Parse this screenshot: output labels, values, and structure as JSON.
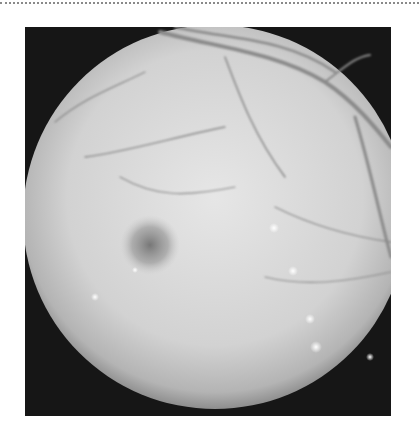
{
  "image": {
    "subject": "fundus-photograph",
    "mode": "grayscale",
    "frame": {
      "x": 25,
      "y": 27,
      "width": 366,
      "height": 389,
      "background": "#161616"
    },
    "disc": {
      "cx": 190,
      "cy": 190,
      "r": 192,
      "fill_center": "#e2e2e2",
      "fill_edge": "#9a9a9a"
    },
    "macula": {
      "cx": 125,
      "cy": 218,
      "r": 26,
      "color": "#7c7c7c"
    },
    "vessel_color": "#8a8a8a",
    "exudate_color": "#f6f6f6",
    "exudates": [
      {
        "x": 249,
        "y": 201,
        "r": 4
      },
      {
        "x": 268,
        "y": 244,
        "r": 4
      },
      {
        "x": 285,
        "y": 292,
        "r": 4
      },
      {
        "x": 291,
        "y": 320,
        "r": 5
      },
      {
        "x": 70,
        "y": 270,
        "r": 3
      },
      {
        "x": 110,
        "y": 243,
        "r": 3
      },
      {
        "x": 345,
        "y": 330,
        "r": 3
      }
    ]
  },
  "decor": {
    "dotted_rule_color": "#8a8a8a"
  }
}
